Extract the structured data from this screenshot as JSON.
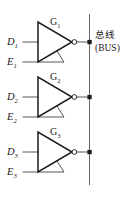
{
  "figure": {
    "type": "logic-circuit-diagram",
    "background_color": "#ffffff",
    "line_color": "#1a1a1a",
    "wire_color": "#3a3a3a",
    "bus_color": "#555555"
  },
  "bus": {
    "label_cn": "总线",
    "label_en": "(BUS)",
    "x": 89,
    "y_top": 14,
    "y_bottom": 185,
    "junction_dots_y": [
      42,
      97,
      152
    ]
  },
  "gates": [
    {
      "name": "G₁",
      "name_base": "G",
      "name_sub": "1",
      "data_input": "D₁",
      "data_input_base": "D",
      "data_input_sub": "1",
      "enable_input": "E₁",
      "enable_input_base": "E",
      "enable_input_sub": "1",
      "symbol": "tri-state-inverter",
      "has_bubble": true,
      "output_to": "bus"
    },
    {
      "name": "G₂",
      "name_base": "G",
      "name_sub": "2",
      "data_input": "D₂",
      "data_input_base": "D",
      "data_input_sub": "2",
      "enable_input": "E₂",
      "enable_input_base": "E",
      "enable_input_sub": "2",
      "symbol": "tri-state-inverter",
      "has_bubble": true,
      "output_to": "bus"
    },
    {
      "name": "G₃",
      "name_base": "G",
      "name_sub": "3",
      "data_input": "D₃",
      "data_input_base": "D",
      "data_input_sub": "3",
      "enable_input": "E₃",
      "enable_input_base": "E",
      "enable_input_sub": "3",
      "symbol": "tri-state-inverter",
      "has_bubble": true,
      "output_to": "bus"
    }
  ]
}
